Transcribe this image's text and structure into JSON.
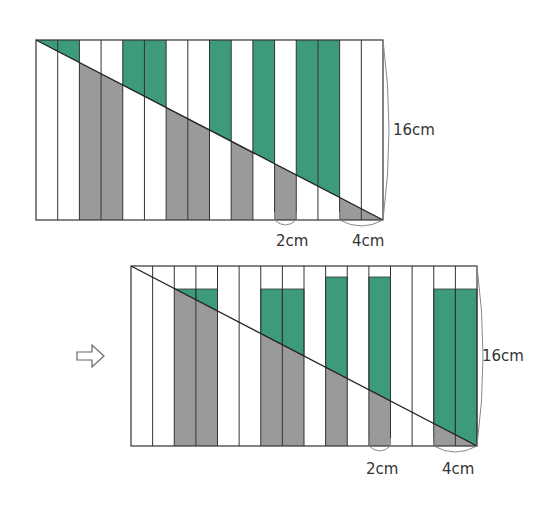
{
  "colors": {
    "green": "#3d9b7c",
    "gray": "#9a9a9a",
    "stroke": "#333333",
    "brace": "#888888"
  },
  "top_figure": {
    "rect": {
      "x": 36,
      "y": 40,
      "w": 347,
      "h": 180
    },
    "columns": 16,
    "column_fill": [
      "green-above",
      "green-above",
      "gray-below",
      "gray-below",
      "green-above",
      "green-above",
      "gray-below",
      "gray-below",
      "green-above",
      "gray-below",
      "green-above",
      "gray-below",
      "green-above",
      "green-above",
      "gray-below",
      "gray-below"
    ],
    "labels": {
      "height": "16cm",
      "strip_width": "2cm",
      "double_strip_width": "4cm"
    }
  },
  "arrow": {
    "icon": "hollow-right-arrow"
  },
  "bottom_figure": {
    "rect": {
      "x": 131,
      "y": 266,
      "w": 346,
      "h": 180
    },
    "columns": 16,
    "green_caps": [
      {
        "cols": [
          2,
          3
        ],
        "top": 289
      },
      {
        "cols": [
          6,
          7
        ],
        "top": 289
      },
      {
        "cols": [
          9
        ],
        "top": 277
      },
      {
        "cols": [
          11
        ],
        "top": 277
      },
      {
        "cols": [
          14,
          15
        ],
        "top": 289
      }
    ],
    "labels": {
      "height": "16cm",
      "strip_width": "2cm",
      "double_strip_width": "4cm"
    }
  }
}
